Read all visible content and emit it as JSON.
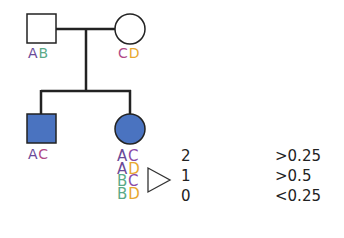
{
  "colors": {
    "A": "#6a4a98",
    "B": "#5aaa88",
    "C": "#b04a88",
    "C_alt": "#8a4aa8",
    "D": "#e8a830",
    "affected_fill": "#4a73c0",
    "line": "#222222"
  },
  "pedigree": {
    "father": {
      "shape": "square",
      "affected": false,
      "alleles": [
        "A",
        "B"
      ]
    },
    "mother": {
      "shape": "circle",
      "affected": false,
      "alleles": [
        "C",
        "D"
      ]
    },
    "son": {
      "shape": "square",
      "affected": true,
      "alleles": [
        "A",
        "C"
      ]
    },
    "daughter": {
      "shape": "circle",
      "affected": true,
      "alleles": [
        "A",
        "C"
      ]
    }
  },
  "table": {
    "rows": [
      {
        "genotype": [
          "A",
          "C"
        ],
        "shared": "2",
        "probability": ">0.25"
      },
      {
        "genotype": [
          "A",
          "D"
        ],
        "shared": "1",
        "probability": ">0.5"
      },
      {
        "genotype": [
          "B",
          "C"
        ],
        "shared": "",
        "probability": ""
      },
      {
        "genotype": [
          "B",
          "D"
        ],
        "shared": "0",
        "probability": "<0.25"
      }
    ]
  },
  "labels": {
    "father_a1": "A",
    "father_a2": "B",
    "mother_a1": "C",
    "mother_a2": "D",
    "son_a1": "A",
    "son_a2": "C",
    "g1_a1": "A",
    "g1_a2": "C",
    "g2_a1": "A",
    "g2_a2": "D",
    "g3_a1": "B",
    "g3_a2": "C",
    "g4_a1": "B",
    "g4_a2": "D",
    "n2": "2",
    "n1": "1",
    "n0": "0",
    "p2": ">0.25",
    "p1": ">0.5",
    "p0": "<0.25"
  }
}
